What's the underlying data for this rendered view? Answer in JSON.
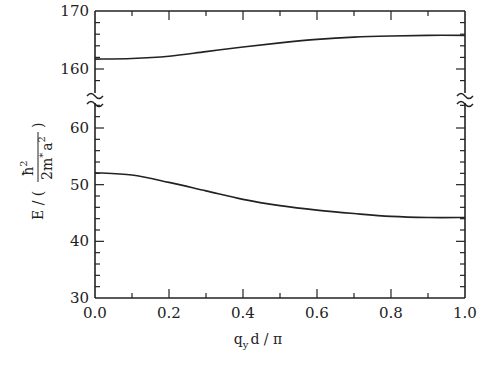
{
  "chart_data": {
    "type": "line",
    "title": "",
    "xlabel": "q_y d / π",
    "ylabel": "E / ( ħ² / (2m* a²) )",
    "xlim": [
      0.0,
      1.0
    ],
    "ylim_segments": [
      [
        30,
        60
      ],
      [
        160,
        170
      ]
    ],
    "axis_break": true,
    "grid": false,
    "legend": null,
    "x_ticks": [
      "0.0",
      "0.2",
      "0.4",
      "0.6",
      "0.8",
      "1.0"
    ],
    "y_ticks_lower": [
      "30",
      "40",
      "50",
      "60"
    ],
    "y_ticks_upper": [
      "160",
      "170"
    ],
    "series": [
      {
        "name": "upper band",
        "x": [
          0.0,
          0.1,
          0.2,
          0.3,
          0.4,
          0.5,
          0.6,
          0.7,
          0.8,
          0.9,
          1.0
        ],
        "values": [
          161.7,
          161.8,
          162.2,
          163.0,
          163.8,
          164.5,
          165.1,
          165.5,
          165.7,
          165.8,
          165.8
        ]
      },
      {
        "name": "lower band",
        "x": [
          0.0,
          0.1,
          0.2,
          0.3,
          0.4,
          0.5,
          0.6,
          0.7,
          0.8,
          0.9,
          1.0
        ],
        "values": [
          52.1,
          51.7,
          50.4,
          48.9,
          47.4,
          46.3,
          45.5,
          44.9,
          44.4,
          44.2,
          44.2
        ]
      }
    ]
  },
  "labels": {
    "x_axis": "q",
    "x_axis_sub": "y",
    "x_axis_rest": "d / π",
    "y_axis_prefix": "E / (",
    "y_axis_num": "ħ",
    "y_axis_num_sup": "2",
    "y_axis_den": "2m",
    "y_axis_den_star": "*",
    "y_axis_den_a": "a",
    "y_axis_den_sup": "2",
    "y_axis_suffix": ")"
  }
}
